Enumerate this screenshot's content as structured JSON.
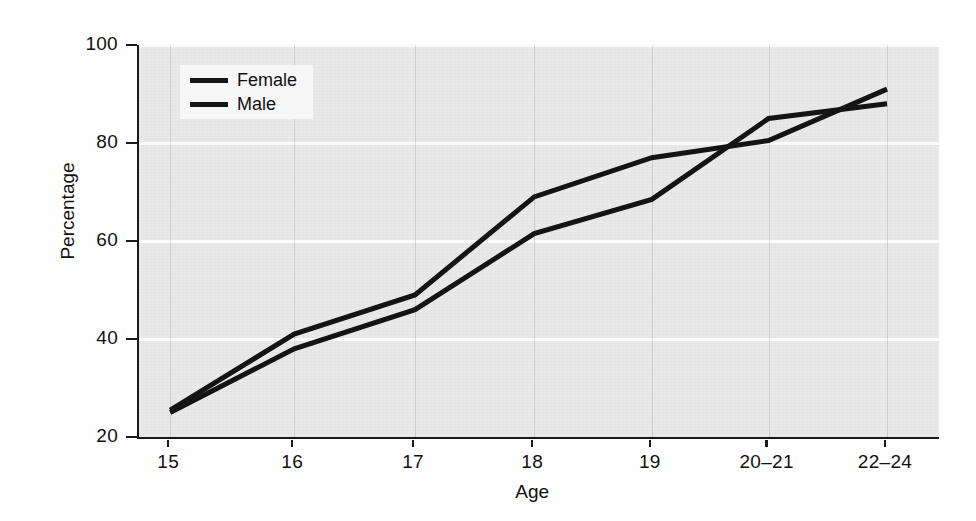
{
  "chart_data": {
    "type": "line",
    "title": "",
    "xlabel": "Age",
    "ylabel": "Percentage",
    "categories": [
      "15",
      "16",
      "17",
      "18",
      "19",
      "20–21",
      "22–24"
    ],
    "ylim": [
      20,
      100
    ],
    "yticks": [
      20,
      40,
      60,
      80,
      100
    ],
    "grid": true,
    "legend_position": "top-left",
    "series": [
      {
        "name": "Female",
        "values": [
          25.5,
          41,
          49,
          69,
          77,
          80.5,
          91
        ],
        "color": "#141414"
      },
      {
        "name": "Male",
        "values": [
          25,
          38,
          46,
          61.5,
          68.5,
          85,
          88
        ],
        "color": "#141414"
      }
    ]
  },
  "axes": {
    "y_label": "Percentage",
    "x_label": "Age",
    "y_tick_labels": [
      "20",
      "40",
      "60",
      "80",
      "100"
    ],
    "x_tick_labels": [
      "15",
      "16",
      "17",
      "18",
      "19",
      "20–21",
      "22–24"
    ]
  },
  "legend": {
    "entries": [
      {
        "label": "Female"
      },
      {
        "label": "Male"
      }
    ]
  },
  "colors": {
    "line": "#141414",
    "plot_background": "#e9e9e9",
    "gridline": "#fbfbfb",
    "axis": "#1a1a1a",
    "page_background": "#fefefe"
  }
}
